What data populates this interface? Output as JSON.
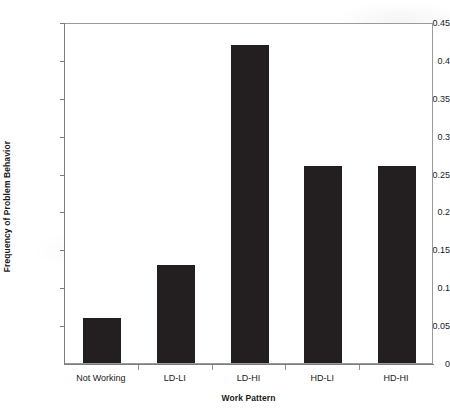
{
  "chart_data": {
    "type": "bar",
    "title": "",
    "xlabel": "Work Pattern",
    "ylabel": "Frequency of Problem Behavior",
    "categories": [
      "Not Working",
      "LD-LI",
      "LD-HI",
      "HD-LI",
      "HD-HI"
    ],
    "values": [
      0.06,
      0.13,
      0.42,
      0.26,
      0.26
    ],
    "ylim": [
      0,
      0.45
    ],
    "ytick_labels": [
      "0",
      "0.05",
      "0.1",
      "0.15",
      "0.2",
      "0.25",
      "0.3",
      "0.35",
      "0.4",
      "0.45"
    ],
    "ytick_values": [
      0,
      0.05,
      0.1,
      0.15,
      0.2,
      0.25,
      0.3,
      0.35,
      0.4,
      0.45
    ],
    "grid": false,
    "legend": false,
    "legend_position": "none",
    "series": [
      {
        "name": "Frequency of Problem Behavior",
        "values": [
          0.06,
          0.13,
          0.42,
          0.26,
          0.26
        ],
        "color": "#231f20"
      }
    ]
  },
  "colors": {
    "bar": "#231f20",
    "axis": "#7c7c7c",
    "frame": "#9a9a9a",
    "text": "#1a1a1a",
    "background": "#ffffff"
  }
}
